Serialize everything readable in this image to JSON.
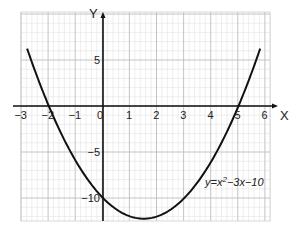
{
  "chart_data": {
    "type": "line",
    "title": "",
    "xlabel": "X",
    "ylabel": "Y",
    "equation_label": "y=x²−3x−10",
    "equation": {
      "a": 1,
      "b": -3,
      "c": -10
    },
    "xlim": [
      -3,
      6.1
    ],
    "ylim": [
      -12.5,
      10.2
    ],
    "x_ticks": [
      -3,
      -2,
      -1,
      0,
      1,
      2,
      3,
      4,
      5,
      6
    ],
    "x_tick_labels": [
      "−3",
      "−2",
      "−1",
      "0",
      "1",
      "2",
      "3",
      "4",
      "5",
      "6"
    ],
    "y_ticks": [
      5,
      -5,
      -10
    ],
    "y_tick_labels": [
      "5",
      "−5",
      "−10"
    ],
    "grid": true,
    "series": [
      {
        "name": "y=x²−3x−10",
        "x": [
          -2.8,
          -2,
          -1,
          0,
          1,
          1.5,
          2,
          3,
          4,
          5,
          5.8
        ],
        "values": [
          5.24,
          0,
          -6,
          -10,
          -12,
          -12.25,
          -12,
          -10,
          -6,
          0,
          5.24
        ]
      }
    ],
    "roots": [
      -2,
      5
    ],
    "vertex": [
      1.5,
      -12.25
    ],
    "y_intercept": -10
  },
  "colors": {
    "grid_major": "#bdbdbd",
    "grid_minor": "#e2e2e2",
    "axis": "#111111",
    "curve": "#111111"
  }
}
